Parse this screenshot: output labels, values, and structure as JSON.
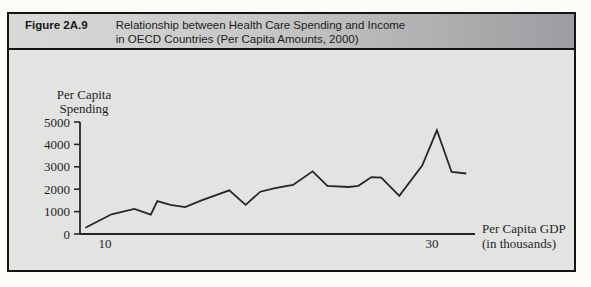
{
  "figure": {
    "label": "Figure 2A.9",
    "title_line1": "Relationship between Health Care Spending and Income",
    "title_line2": "in OECD Countries (Per Capita Amounts, 2000)"
  },
  "chart_data": {
    "type": "line",
    "title": "Relationship between Health Care Spending and Income in OECD Countries (Per Capita Amounts, 2000)",
    "xlabel_line1": "Per Capita GDP",
    "xlabel_line2": "(in thousands)",
    "ylabel_line1": "Per Capita",
    "ylabel_line2": "Spending",
    "x_ticks": [
      10,
      30
    ],
    "y_ticks": [
      5000,
      4000,
      3000,
      2000,
      1000,
      0
    ],
    "xlim": [
      8.5,
      32.6
    ],
    "ylim": [
      0,
      5000
    ],
    "grid": false,
    "legend": "none",
    "line_color": "#262626",
    "series": [
      {
        "name": "OECD countries (per capita GDP vs per capita health spending)",
        "x": [
          8.8,
          10.4,
          11.8,
          12.8,
          13.2,
          14.0,
          14.9,
          15.9,
          17.6,
          18.6,
          19.5,
          20.4,
          21.5,
          22.7,
          23.6,
          24.9,
          25.5,
          26.3,
          26.9,
          28.0,
          29.4,
          30.3,
          31.2,
          32.1
        ],
        "y": [
          280,
          880,
          1120,
          860,
          1470,
          1300,
          1200,
          1500,
          1950,
          1300,
          1890,
          2050,
          2190,
          2800,
          2150,
          2100,
          2150,
          2540,
          2520,
          1700,
          3060,
          4630,
          2770,
          2700
        ]
      }
    ]
  },
  "colors": {
    "frame_border": "#141414",
    "panel_background": "#e2e4e1",
    "header_gradient_left": "#d9d9d7",
    "header_gradient_right": "#9d9da1",
    "line": "#262626"
  }
}
